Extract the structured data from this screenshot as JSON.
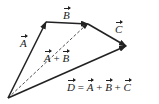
{
  "diagram": {
    "points": {
      "origin": [
        8,
        98
      ],
      "a_tip": [
        46,
        22
      ],
      "b_tip": [
        88,
        24
      ],
      "c_tip": [
        126,
        46
      ]
    },
    "vectors": [
      {
        "name": "A",
        "label": "A",
        "from": "origin",
        "to": "a_tip",
        "style": "solid"
      },
      {
        "name": "B",
        "label": "B",
        "from": "a_tip",
        "to": "b_tip",
        "style": "solid"
      },
      {
        "name": "C",
        "label": "C",
        "from": "b_tip",
        "to": "c_tip",
        "style": "solid"
      },
      {
        "name": "A+B",
        "label": "A + B",
        "from": "origin",
        "to": "b_tip",
        "style": "dashed"
      },
      {
        "name": "D",
        "label": "D = A + B + C",
        "from": "origin",
        "to": "c_tip",
        "style": "solid"
      }
    ],
    "labels": {
      "a": "A",
      "b": "B",
      "c": "C",
      "ab_a": "A",
      "ab_plus": " + ",
      "ab_b": "B",
      "d": "D",
      "eq": " = ",
      "d_a": "A",
      "plus1": " + ",
      "d_b": "B",
      "plus2": " + ",
      "d_c": "C"
    },
    "color": "#222222"
  }
}
